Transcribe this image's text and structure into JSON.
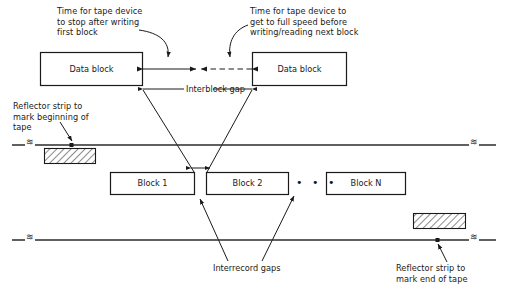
{
  "figure": {
    "colors": {
      "ink": "#1a1a1a",
      "line": "#2b2b2b",
      "hatch": "#2b2b2b",
      "background": "#ffffff"
    }
  },
  "annotations": {
    "stop_time": {
      "line1": "Time for tape device",
      "line2": "to stop after writing",
      "line3": "first block"
    },
    "speed_time": {
      "line1": "Time for tape device to",
      "line2": "get to full speed before",
      "line3": "writing/reading next block"
    },
    "reflector_begin": {
      "line1": "Reflector strip to",
      "line2": "mark beginning of",
      "line3": "tape"
    },
    "reflector_end": {
      "line1": "Reflector strip to",
      "line2": "mark end of tape"
    },
    "interblock_gap": "Interblock gap",
    "interrecord_gaps": "Interrecord gaps"
  },
  "data_blocks": [
    {
      "label": "Data block"
    },
    {
      "label": "Data block"
    }
  ],
  "tape_blocks": [
    {
      "label": "Block 1"
    },
    {
      "label": "Block 2"
    },
    {
      "label": "Block N"
    }
  ],
  "ellipsis": "• • •",
  "tape_break_symbol": "≋"
}
